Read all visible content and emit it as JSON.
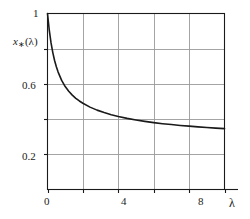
{
  "chart_data": {
    "type": "line",
    "title": "",
    "xlabel": "λ",
    "ylabel": "x∗(λ)",
    "ylabel_base": "x",
    "ylabel_sub": "∗",
    "ylabel_arg": "(λ)",
    "xlim": [
      0,
      10
    ],
    "ylim": [
      0,
      1
    ],
    "grid": true,
    "legend": null,
    "x_ticks": [
      0,
      4,
      8
    ],
    "x_tick_labels": [
      "0",
      "4",
      "8"
    ],
    "x_gridlines": [
      0,
      2,
      4,
      6,
      8,
      10
    ],
    "y_ticks": [
      0.2,
      0.6,
      1
    ],
    "y_tick_labels": [
      "0.2",
      "0.6",
      "1"
    ],
    "y_gridlines": [
      0.2,
      0.4,
      0.6,
      0.8,
      1.0
    ],
    "line_color": "#1a1a1a",
    "grid_color": "#9a9a9a",
    "frame_color": "#1a1a1a",
    "series": [
      {
        "name": "x∗(λ)",
        "x": [
          0.0,
          0.1,
          0.2,
          0.3,
          0.4,
          0.5,
          0.6,
          0.8,
          1.0,
          1.2,
          1.4,
          1.6,
          1.8,
          2.0,
          2.4,
          2.8,
          3.2,
          3.6,
          4.0,
          4.5,
          5.0,
          5.5,
          6.0,
          6.5,
          7.0,
          7.5,
          8.0,
          8.5,
          9.0,
          9.5,
          10.0
        ],
        "y": [
          1.0,
          0.905,
          0.833,
          0.778,
          0.733,
          0.697,
          0.667,
          0.62,
          0.585,
          0.558,
          0.536,
          0.518,
          0.503,
          0.49,
          0.468,
          0.451,
          0.437,
          0.425,
          0.415,
          0.404,
          0.395,
          0.387,
          0.38,
          0.374,
          0.369,
          0.364,
          0.36,
          0.356,
          0.352,
          0.349,
          0.346
        ]
      }
    ]
  }
}
